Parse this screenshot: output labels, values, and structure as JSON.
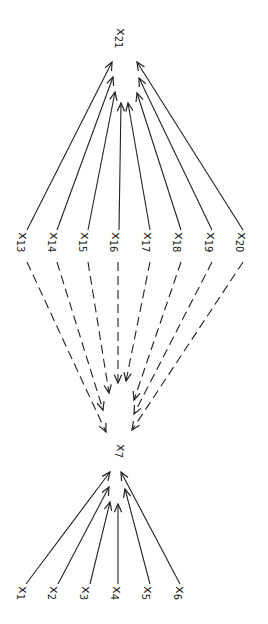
{
  "diagram": {
    "type": "path-diagram",
    "stroke_color": "#222222",
    "background": "#ffffff",
    "nodes": [
      {
        "id": "x1",
        "base": "x",
        "sub": "1",
        "x": 30,
        "y": 586
      },
      {
        "id": "x2",
        "base": "x",
        "sub": "2",
        "x": 61,
        "y": 586
      },
      {
        "id": "x3",
        "base": "x",
        "sub": "3",
        "x": 93,
        "y": 586
      },
      {
        "id": "x4",
        "base": "x",
        "sub": "4",
        "x": 124,
        "y": 586
      },
      {
        "id": "x5",
        "base": "x",
        "sub": "5",
        "x": 155,
        "y": 586
      },
      {
        "id": "x6",
        "base": "x",
        "sub": "6",
        "x": 187,
        "y": 586
      },
      {
        "id": "x7",
        "base": "x",
        "sub": "7",
        "x": 128,
        "y": 444
      },
      {
        "id": "x13",
        "base": "x",
        "sub": "13",
        "x": 30,
        "y": 232
      },
      {
        "id": "x14",
        "base": "x",
        "sub": "14",
        "x": 61,
        "y": 232
      },
      {
        "id": "x15",
        "base": "x",
        "sub": "15",
        "x": 92,
        "y": 232
      },
      {
        "id": "x16",
        "base": "x",
        "sub": "16",
        "x": 123,
        "y": 232
      },
      {
        "id": "x17",
        "base": "x",
        "sub": "17",
        "x": 155,
        "y": 232
      },
      {
        "id": "x18",
        "base": "x",
        "sub": "18",
        "x": 186,
        "y": 232
      },
      {
        "id": "x19",
        "base": "x",
        "sub": "19",
        "x": 218,
        "y": 232
      },
      {
        "id": "x20",
        "base": "x",
        "sub": "20",
        "x": 249,
        "y": 232
      },
      {
        "id": "x21",
        "base": "x",
        "sub": "21",
        "x": 128,
        "y": 28
      }
    ],
    "edges": [
      {
        "from": "x1",
        "to": "x7",
        "style": "solid",
        "x1": 26,
        "y1": 584,
        "x2": 110,
        "y2": 472
      },
      {
        "from": "x2",
        "to": "x7",
        "style": "solid",
        "x1": 58,
        "y1": 584,
        "x2": 109,
        "y2": 487
      },
      {
        "from": "x3",
        "to": "x7",
        "style": "solid",
        "x1": 90,
        "y1": 584,
        "x2": 110,
        "y2": 502
      },
      {
        "from": "x4",
        "to": "x7",
        "style": "solid",
        "x1": 118,
        "y1": 584,
        "x2": 118,
        "y2": 504
      },
      {
        "from": "x5",
        "to": "x7",
        "style": "solid",
        "x1": 150,
        "y1": 584,
        "x2": 125,
        "y2": 489
      },
      {
        "from": "x6",
        "to": "x7",
        "style": "solid",
        "x1": 180,
        "y1": 584,
        "x2": 121,
        "y2": 472
      },
      {
        "from": "x13",
        "to": "x7",
        "style": "dashed",
        "x1": 27,
        "y1": 262,
        "x2": 106,
        "y2": 432
      },
      {
        "from": "x14",
        "to": "x7",
        "style": "dashed",
        "x1": 57,
        "y1": 262,
        "x2": 103,
        "y2": 410
      },
      {
        "from": "x15",
        "to": "x7",
        "style": "dashed",
        "x1": 88,
        "y1": 262,
        "x2": 109,
        "y2": 393
      },
      {
        "from": "x16",
        "to": "x7",
        "style": "dashed",
        "x1": 118,
        "y1": 262,
        "x2": 118,
        "y2": 383
      },
      {
        "from": "x17",
        "to": "x7",
        "style": "dashed",
        "x1": 150,
        "y1": 262,
        "x2": 126,
        "y2": 381
      },
      {
        "from": "x18",
        "to": "x7",
        "style": "dashed",
        "x1": 181,
        "y1": 262,
        "x2": 134,
        "y2": 400
      },
      {
        "from": "x19",
        "to": "x7",
        "style": "dashed",
        "x1": 212,
        "y1": 262,
        "x2": 134,
        "y2": 414
      },
      {
        "from": "x20",
        "to": "x7",
        "style": "dashed",
        "x1": 243,
        "y1": 262,
        "x2": 132,
        "y2": 430
      },
      {
        "from": "x13",
        "to": "x21",
        "style": "solid",
        "x1": 27,
        "y1": 230,
        "x2": 112,
        "y2": 62
      },
      {
        "from": "x14",
        "to": "x21",
        "style": "solid",
        "x1": 57,
        "y1": 230,
        "x2": 113,
        "y2": 77
      },
      {
        "from": "x15",
        "to": "x21",
        "style": "solid",
        "x1": 88,
        "y1": 230,
        "x2": 115,
        "y2": 92
      },
      {
        "from": "x16",
        "to": "x21",
        "style": "solid",
        "x1": 119,
        "y1": 230,
        "x2": 121,
        "y2": 103
      },
      {
        "from": "x17",
        "to": "x21",
        "style": "solid",
        "x1": 150,
        "y1": 230,
        "x2": 128,
        "y2": 103
      },
      {
        "from": "x18",
        "to": "x21",
        "style": "solid",
        "x1": 181,
        "y1": 230,
        "x2": 137,
        "y2": 93
      },
      {
        "from": "x19",
        "to": "x21",
        "style": "solid",
        "x1": 212,
        "y1": 230,
        "x2": 139,
        "y2": 78
      },
      {
        "from": "x20",
        "to": "x21",
        "style": "solid",
        "x1": 243,
        "y1": 230,
        "x2": 137,
        "y2": 62
      }
    ]
  }
}
